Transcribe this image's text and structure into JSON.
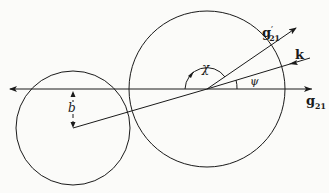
{
  "diagram": {
    "colors": {
      "stroke": "#1a1a1a",
      "background": "#fbfbf9"
    },
    "labels": {
      "g21_prime": {
        "base": "g",
        "sub": "21",
        "prime": "′"
      },
      "k": "k",
      "chi": "χ",
      "psi": "ψ",
      "g21": {
        "base": "g",
        "sub": "21"
      },
      "b": "b"
    },
    "shapes": {
      "large_circle": {
        "cx": 207,
        "cy": 89,
        "r": 78
      },
      "small_circle": {
        "cx": 73,
        "cy": 128,
        "r": 57
      },
      "axis_line": {
        "x1": 10,
        "y1": 89,
        "x2": 312,
        "y2": 89
      },
      "impact_line": {
        "x1": 73,
        "y1": 128,
        "x2": 207,
        "y2": 89
      },
      "g21_prime_line": {
        "x1": 207,
        "y1": 89,
        "x2": 296,
        "y2": 28
      },
      "k_line": {
        "x1": 310,
        "y1": 58,
        "x2": 207,
        "y2": 89
      }
    }
  }
}
